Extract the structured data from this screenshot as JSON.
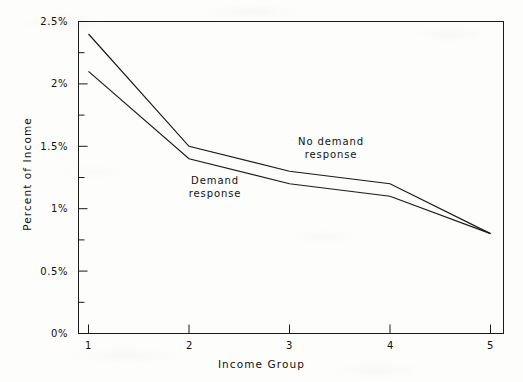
{
  "chart_data": {
    "type": "line",
    "title": "",
    "xlabel": "Income Group",
    "ylabel": "Percent of Income",
    "x": [
      1,
      2,
      3,
      4,
      5
    ],
    "categories": [
      "1",
      "2",
      "3",
      "4",
      "5"
    ],
    "xtick_labels": [
      "1",
      "2",
      "3",
      "4",
      "5"
    ],
    "ytick_labels": [
      "0%",
      "0.5%",
      "1%",
      "1.5%",
      "2%",
      "2.5%"
    ],
    "ytick_values": [
      0,
      0.5,
      1,
      1.5,
      2,
      2.5
    ],
    "yminor_tick_values": [
      0.25,
      0.75,
      1.25,
      1.75,
      2.25
    ],
    "xlim": [
      1,
      5
    ],
    "ylim": [
      0,
      2.5
    ],
    "grid": false,
    "legend_position": "inline-annotations",
    "line_color": "#1a1a1a",
    "series": [
      {
        "name": "No demand response",
        "values": [
          2.4,
          1.5,
          1.3,
          1.2,
          0.8
        ]
      },
      {
        "name": "Demand response",
        "values": [
          2.1,
          1.4,
          1.2,
          1.1,
          0.8
        ]
      }
    ],
    "annotations": [
      {
        "name": "no-demand-response",
        "line1": "No demand",
        "line2": "response"
      },
      {
        "name": "demand-response",
        "line1": "Demand",
        "line2": "response"
      }
    ]
  }
}
